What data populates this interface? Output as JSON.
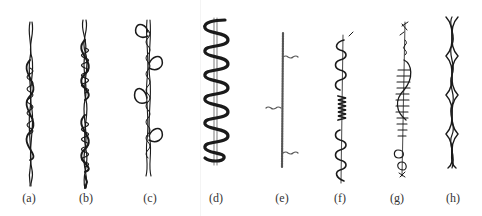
{
  "figure": {
    "type": "fancy-yarn-structures",
    "panels": [
      {
        "id": "a",
        "label": "(a)",
        "style": "spiral-wrapped twisted core"
      },
      {
        "id": "b",
        "label": "(b)",
        "style": "gimp with segmented dense wraps"
      },
      {
        "id": "c",
        "label": "(c)",
        "style": "loop yarn"
      },
      {
        "id": "d",
        "label": "(d)",
        "style": "bold wave/bouclé around core"
      },
      {
        "id": "e",
        "label": "(e)",
        "style": "slub core with side tufts"
      },
      {
        "id": "f",
        "label": "(f)",
        "style": "loops with central knop"
      },
      {
        "id": "g",
        "label": "(g)",
        "style": "chenille-like with knops"
      },
      {
        "id": "h",
        "label": "(h)",
        "style": "plied multi-strand twist"
      }
    ],
    "colors": {
      "ink": "#1a1a1a",
      "ink_light": "#555555",
      "background": "#ffffff"
    }
  }
}
